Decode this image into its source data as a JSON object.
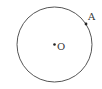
{
  "diagram": {
    "type": "circle-with-points",
    "circle": {
      "cx": 54.5,
      "cy": 44.5,
      "r": 37.5,
      "stroke": "#555555",
      "stroke_width": 1
    },
    "points": [
      {
        "id": "O",
        "label": "O",
        "x": 54.5,
        "y": 44.5,
        "label_x": 57,
        "label_y": 50,
        "role": "center"
      },
      {
        "id": "A",
        "label": "A",
        "x": 86,
        "y": 24,
        "label_x": 88,
        "label_y": 20,
        "role": "on-circle"
      }
    ]
  }
}
